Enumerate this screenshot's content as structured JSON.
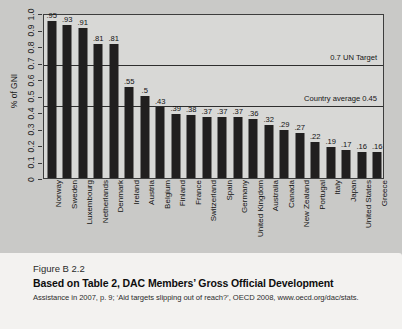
{
  "chart_data": {
    "type": "bar",
    "title": "",
    "xlabel": "",
    "ylabel": "% of GNI",
    "ylim": [
      0,
      1.0
    ],
    "grid": false,
    "legend_position": "none",
    "categories": [
      "Norway",
      "Sweden",
      "Luxembourg",
      "Netherlands",
      "Denmark",
      "Ireland",
      "Austria",
      "Belgium",
      "Finland",
      "France",
      "Switzerland",
      "Spain",
      "Germany",
      "United Kingdom",
      "Australia",
      "Canada",
      "New Zealand",
      "Portugal",
      "Italy",
      "Japan",
      "United States",
      "Greece"
    ],
    "values": [
      0.95,
      0.93,
      0.91,
      0.81,
      0.81,
      0.55,
      0.5,
      0.43,
      0.39,
      0.38,
      0.37,
      0.37,
      0.37,
      0.36,
      0.32,
      0.29,
      0.27,
      0.22,
      0.19,
      0.17,
      0.16,
      0.16
    ],
    "value_labels": [
      ".95",
      ".93",
      ".91",
      ".81",
      ".81",
      ".55",
      ".5",
      ".43",
      ".39",
      ".38",
      ".37",
      ".37",
      ".37",
      ".36",
      ".32",
      ".29",
      ".27",
      ".22",
      ".19",
      ".17",
      ".16",
      ".16"
    ],
    "ytick_labels": [
      "0",
      "0.1",
      "0.2",
      "0.3",
      "0.4",
      "0.5",
      "0.6",
      "0.7",
      "0.8",
      "0.9",
      "1.0"
    ],
    "ytick_values": [
      0,
      0.1,
      0.2,
      0.3,
      0.4,
      0.5,
      0.6,
      0.7,
      0.8,
      0.9,
      1.0
    ],
    "reference_lines": [
      {
        "value": 0.7,
        "label": "0.7 UN Target"
      },
      {
        "value": 0.45,
        "label": "Country average 0.45"
      }
    ],
    "colors": {
      "bar": "#211f1f",
      "plot_background": "#d8d8d6",
      "page_background": "#c9c9c7",
      "caption_background": "#f3f2f0",
      "axis": "#3d3d3d"
    }
  },
  "caption": {
    "figure_number": "Figure B 2.2",
    "title": "Based on Table 2, DAC Members’ Gross Official Development",
    "source": "Assistance in 2007, p. 9; ‘Aid targets slipping out of reach?’, OECD 2008, www.oecd.org/dac/stats."
  }
}
